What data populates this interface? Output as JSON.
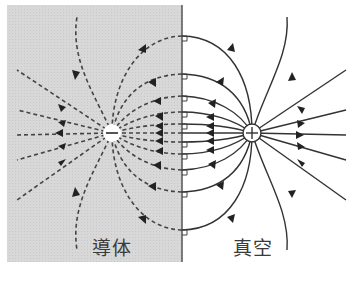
{
  "diagram": {
    "type": "electric field lines - method of image charges",
    "regions": {
      "conductor": {
        "label": "導体",
        "fill": "#d6d6d6"
      },
      "vacuum": {
        "label": "真空",
        "fill": "#ffffff"
      }
    },
    "charges": {
      "image": {
        "sign": "−",
        "x": 112,
        "y": 133
      },
      "real": {
        "sign": "+",
        "x": 252,
        "y": 133
      }
    },
    "boundary_x": 182,
    "line_color": "#333333",
    "dashed_color": "#444444",
    "boundary_intersections_y": [
      20,
      57,
      80,
      96,
      107,
      118,
      133,
      148,
      159,
      170,
      186,
      209,
      246
    ]
  }
}
